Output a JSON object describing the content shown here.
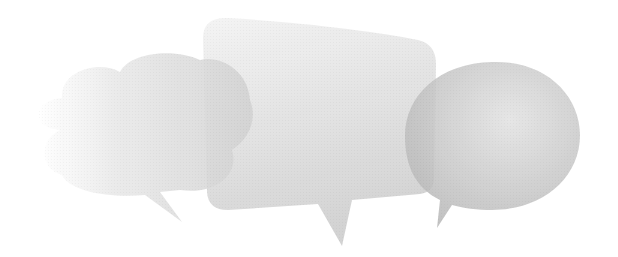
{
  "illustration": {
    "subject": "three overlapping translucent speech bubbles",
    "bubbles": [
      {
        "shape": "cloud",
        "position": "left"
      },
      {
        "shape": "rounded-rectangle",
        "position": "center"
      },
      {
        "shape": "ellipse",
        "position": "right"
      }
    ],
    "colors": {
      "background": "#ffffff",
      "bubble_light": "#f4f4f4",
      "bubble_mid": "#d9d9d9",
      "bubble_dark": "#b8b8b8"
    }
  }
}
